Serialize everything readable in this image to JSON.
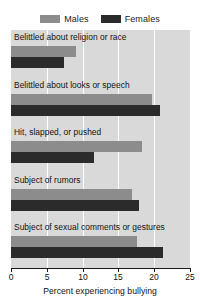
{
  "chart_data": {
    "type": "bar",
    "orientation": "horizontal",
    "title": "",
    "xlabel": "Percent experiencing bullying",
    "ylabel": "",
    "xlim": [
      0,
      25
    ],
    "xticks": [
      0,
      5,
      10,
      15,
      20,
      25
    ],
    "grid": true,
    "legend_position": "top-center",
    "categories": [
      "Belittled about religion or race",
      "Belittled about looks or speech",
      "Hit, slapped, or pushed",
      "Subject of rumors",
      "Subject of sexual comments or gestures"
    ],
    "series": [
      {
        "name": "Males",
        "color": "#8c8c8c",
        "values": [
          9.1,
          19.7,
          18.3,
          16.9,
          17.6
        ]
      },
      {
        "name": "Females",
        "color": "#2b2b2b",
        "values": [
          7.4,
          20.8,
          11.6,
          17.9,
          21.2
        ]
      }
    ]
  },
  "legend": {
    "entries": [
      {
        "label": "Males"
      },
      {
        "label": "Females"
      }
    ]
  },
  "axis": {
    "tick_labels": [
      "0",
      "5",
      "10",
      "15",
      "20",
      "25"
    ],
    "title": "Percent experiencing bullying"
  }
}
